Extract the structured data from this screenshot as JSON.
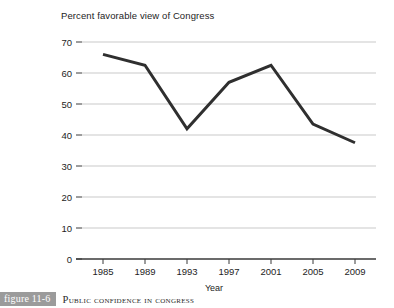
{
  "figure": {
    "badge": "figure 11-6",
    "caption": "Public Confidence in Congress"
  },
  "chart_data": {
    "type": "line",
    "title": "Percent favorable view of Congress",
    "xlabel": "Year",
    "ylabel": "",
    "categories": [
      "1985",
      "1989",
      "1993",
      "1997",
      "2001",
      "2005",
      "2009"
    ],
    "x": [
      1985,
      1989,
      1993,
      1997,
      2001,
      2005,
      2009
    ],
    "values": [
      66,
      62.5,
      42,
      57,
      62.5,
      43.5,
      37.5
    ],
    "series": [
      {
        "name": "Percent favorable view of Congress",
        "values": [
          66,
          62.5,
          42,
          57,
          62.5,
          43.5,
          37.5
        ],
        "color": "#2f2f2f"
      }
    ],
    "ylim": [
      0,
      70
    ],
    "yticks": [
      0,
      10,
      20,
      30,
      40,
      50,
      60,
      70
    ],
    "ytick_labels": [
      "0",
      "10",
      "20",
      "30",
      "40",
      "50",
      "60",
      "70"
    ],
    "grid": true,
    "grid_axis": "y",
    "grid_color": "#c9c9c9",
    "legend": false,
    "legend_position": "none",
    "line_width": 3,
    "markers": false,
    "axis_color": "#3a3a3a"
  }
}
